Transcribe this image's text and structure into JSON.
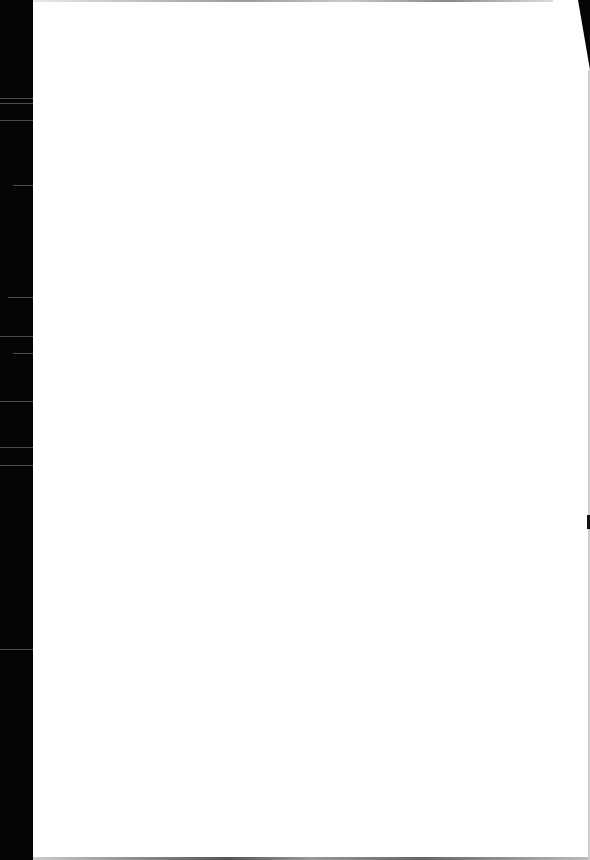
{
  "document": {
    "type": "scanned-page",
    "content_state": "blank",
    "bleed_through_text": [
      "",
      ""
    ],
    "colors": {
      "page": "#ffffff",
      "scanner_edge": "#050505"
    }
  }
}
